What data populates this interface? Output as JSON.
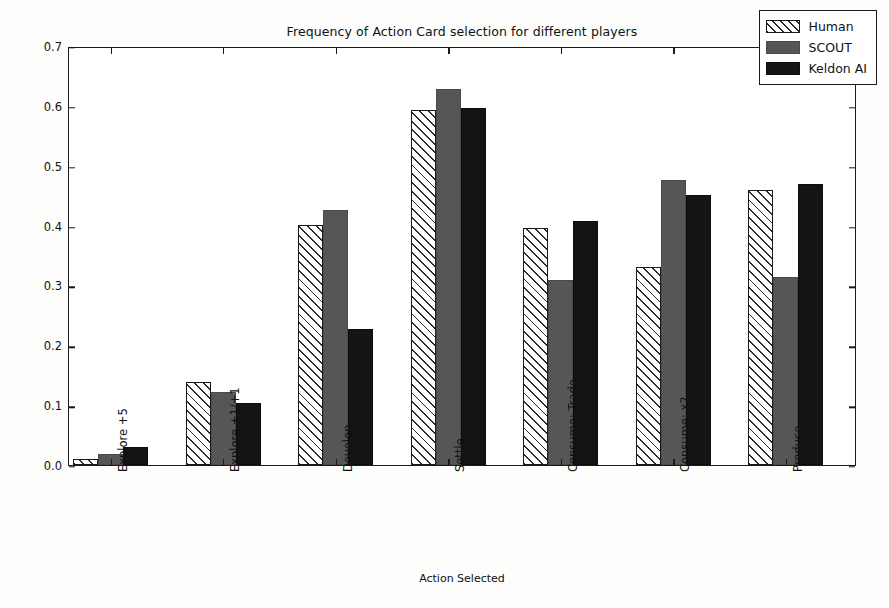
{
  "chart_data": {
    "type": "bar",
    "title": "Frequency of Action Card selection for different players",
    "xlabel": "Action Selected",
    "ylabel": "Frequency (normalized)",
    "ylim": [
      0.0,
      0.7
    ],
    "yticks": [
      "0.0",
      "0.1",
      "0.2",
      "0.3",
      "0.4",
      "0.5",
      "0.6",
      "0.7"
    ],
    "ytick_values": [
      0.0,
      0.1,
      0.2,
      0.3,
      0.4,
      0.5,
      0.6,
      0.7
    ],
    "grid": false,
    "legend_position": "upper right",
    "categories": [
      "Explore +5",
      "Explore +1/+1",
      "Develop",
      "Settle",
      "Consume: Trade",
      "Consume: x2",
      "Produce"
    ],
    "series": [
      {
        "name": "Human",
        "color": "#ffffff",
        "edgecolor": "#1a1a1a",
        "hatch": "///",
        "values": [
          0.01,
          0.139,
          0.401,
          0.593,
          0.396,
          0.33,
          0.459
        ]
      },
      {
        "name": "SCOUT",
        "color": "#565656",
        "edgecolor": "#4a4a4a",
        "hatch": "",
        "values": [
          0.018,
          0.122,
          0.426,
          0.628,
          0.309,
          0.476,
          0.314
        ]
      },
      {
        "name": "Keldon AI",
        "color": "#141414",
        "edgecolor": "#0d0d0d",
        "hatch": "",
        "values": [
          0.03,
          0.104,
          0.228,
          0.596,
          0.407,
          0.451,
          0.469
        ]
      }
    ]
  },
  "legend": {
    "items": [
      {
        "label": "Human"
      },
      {
        "label": "SCOUT"
      },
      {
        "label": "Keldon AI"
      }
    ]
  }
}
